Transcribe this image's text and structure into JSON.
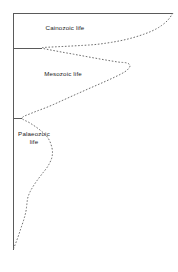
{
  "figure": {
    "type": "spindle-diagram",
    "background_color": "#ffffff",
    "axis_color": "#5a5a5a",
    "curve_color": "#6e6e6e",
    "text_color": "#1c1c1c",
    "width": 178,
    "height": 272
  },
  "labels": {
    "cainozoic": "Cainozoic life",
    "mesozoic": "Mesozoic life",
    "palaeozoic": "Palaeozoic\nlife"
  },
  "chart_data": {
    "type": "area",
    "title": "",
    "xlabel": "",
    "ylabel": "",
    "orientation": "vertical-time-axis",
    "axis": {
      "x": 13,
      "y_top": 13,
      "y_bottom": 250,
      "top_rule_x_end": 173,
      "grid": false,
      "legend": null
    },
    "era_boundaries": [
      {
        "name": "Cainozoic",
        "y": 48,
        "tick_x_end": 42
      },
      {
        "name": "Mesozoic",
        "y": 118,
        "tick_x_end": 22
      }
    ],
    "series": [
      {
        "name": "relative diversity",
        "style": "dashed",
        "points": [
          [
            173,
            13
          ],
          [
            166,
            22
          ],
          [
            152,
            31
          ],
          [
            128,
            39
          ],
          [
            100,
            44
          ],
          [
            72,
            46
          ],
          [
            52,
            47
          ],
          [
            42,
            48
          ],
          [
            56,
            51
          ],
          [
            78,
            55
          ],
          [
            100,
            59
          ],
          [
            118,
            62
          ],
          [
            127,
            63
          ],
          [
            130,
            66
          ],
          [
            126,
            71
          ],
          [
            117,
            76
          ],
          [
            104,
            82
          ],
          [
            88,
            89
          ],
          [
            70,
            97
          ],
          [
            50,
            106
          ],
          [
            32,
            113
          ],
          [
            22,
            118
          ],
          [
            30,
            123
          ],
          [
            40,
            130
          ],
          [
            48,
            138
          ],
          [
            52,
            148
          ],
          [
            52,
            157
          ],
          [
            48,
            166
          ],
          [
            42,
            174
          ],
          [
            36,
            182
          ],
          [
            31,
            190
          ],
          [
            28,
            197
          ],
          [
            27,
            203
          ],
          [
            26,
            211
          ],
          [
            24,
            219
          ],
          [
            21,
            228
          ],
          [
            18,
            237
          ],
          [
            15,
            245
          ],
          [
            13,
            250
          ]
        ]
      }
    ]
  }
}
